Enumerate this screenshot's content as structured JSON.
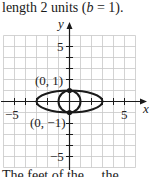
{
  "caption_top": {
    "prefix": "length 2 units ",
    "open": "(",
    "var": "b",
    "eq": " = 1",
    "close": ")",
    "end": "."
  },
  "caption_bottom": "The feet of the ... the ...",
  "graph": {
    "x_axis_label": "x",
    "y_axis_label": "y",
    "x_ticks_labeled": [
      "−5",
      "5"
    ],
    "y_ticks_labeled": [
      "5",
      "−5"
    ],
    "points": [
      {
        "label": "(0, 1)",
        "x": 0,
        "y": 1
      },
      {
        "label": "(0, −1)",
        "x": 0,
        "y": -1
      }
    ],
    "curves": [
      {
        "type": "ellipse",
        "cx": 0,
        "cy": 0,
        "rx": 3,
        "ry": 1
      },
      {
        "type": "circle",
        "cx": 0,
        "cy": 0,
        "r": 1
      }
    ],
    "range": {
      "x": [
        -6,
        6
      ],
      "y": [
        -6,
        6
      ]
    },
    "grid": true,
    "colors": {
      "grid": "#c8c8c8",
      "axis": "#1a1a1a",
      "curve": "#1a1a1a"
    }
  }
}
